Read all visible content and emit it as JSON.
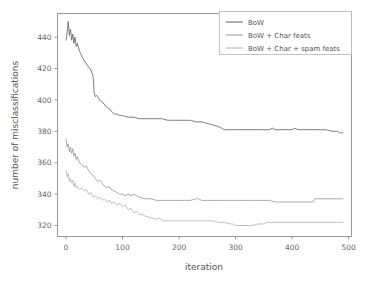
{
  "chart_data": {
    "type": "line",
    "title": "",
    "xlabel": "iteration",
    "ylabel": "number of misclassifications",
    "xlim": [
      -15,
      505
    ],
    "ylim": [
      313,
      455
    ],
    "xticks": [
      0,
      100,
      200,
      300,
      400,
      500
    ],
    "yticks": [
      320,
      340,
      360,
      380,
      400,
      420,
      440
    ],
    "grid": false,
    "legend_position": "upper right",
    "series": [
      {
        "name": "BoW",
        "color": "#6e6e6e",
        "x": [
          0,
          2,
          4,
          6,
          8,
          10,
          12,
          14,
          16,
          18,
          20,
          24,
          28,
          32,
          36,
          40,
          44,
          46,
          48,
          50,
          52,
          54,
          58,
          62,
          66,
          70,
          74,
          78,
          82,
          86,
          90,
          95,
          100,
          110,
          120,
          130,
          140,
          150,
          160,
          170,
          180,
          190,
          200,
          210,
          220,
          230,
          240,
          250,
          260,
          270,
          280,
          285,
          290,
          300,
          320,
          340,
          360,
          365,
          370,
          380,
          400,
          405,
          410,
          430,
          450,
          460,
          470,
          480,
          485,
          490
        ],
        "y": [
          438,
          443,
          450,
          441,
          445,
          438,
          442,
          436,
          440,
          434,
          436,
          431,
          428,
          425,
          423,
          421,
          419,
          417,
          415,
          404,
          402,
          403,
          401,
          399,
          398,
          396,
          395,
          394,
          392,
          391,
          391,
          390,
          390,
          389,
          389,
          388,
          388,
          388,
          388,
          388,
          387,
          387,
          387,
          387,
          387,
          386,
          386,
          385,
          384,
          383,
          381,
          381,
          381,
          381,
          381,
          381,
          381,
          382,
          381,
          381,
          381,
          382,
          381,
          381,
          381,
          381,
          380,
          380,
          379,
          379
        ]
      },
      {
        "name": "BoW + Char feats",
        "color": "#a0a0a0",
        "x": [
          0,
          2,
          4,
          6,
          8,
          10,
          12,
          14,
          16,
          18,
          20,
          24,
          28,
          32,
          36,
          40,
          44,
          48,
          52,
          56,
          60,
          64,
          68,
          72,
          76,
          80,
          85,
          90,
          95,
          100,
          105,
          110,
          115,
          120,
          125,
          130,
          140,
          150,
          160,
          170,
          180,
          190,
          200,
          210,
          220,
          230,
          235,
          240,
          250,
          260,
          270,
          280,
          290,
          300,
          310,
          320,
          330,
          340,
          350,
          360,
          370,
          380,
          390,
          400,
          410,
          420,
          430,
          437,
          440,
          450,
          460,
          470,
          480,
          490
        ],
        "y": [
          375,
          370,
          372,
          367,
          370,
          366,
          369,
          364,
          366,
          362,
          364,
          360,
          359,
          357,
          358,
          355,
          353,
          352,
          350,
          348,
          349,
          347,
          345,
          344,
          345,
          343,
          342,
          341,
          340,
          340,
          339,
          340,
          339,
          340,
          339,
          338,
          337,
          337,
          336,
          336,
          336,
          336,
          336,
          336,
          336,
          337,
          337,
          336,
          336,
          336,
          336,
          336,
          336,
          336,
          336,
          336,
          336,
          336,
          336,
          336,
          335,
          335,
          335,
          335,
          335,
          335,
          335,
          335,
          337,
          337,
          337,
          337,
          337,
          337
        ]
      },
      {
        "name": "BoW + Char + spam feats",
        "color": "#b8b8b8",
        "x": [
          0,
          2,
          4,
          6,
          8,
          10,
          12,
          14,
          16,
          18,
          20,
          24,
          28,
          32,
          36,
          40,
          44,
          48,
          52,
          56,
          60,
          64,
          68,
          72,
          76,
          80,
          85,
          90,
          95,
          100,
          105,
          110,
          115,
          120,
          125,
          130,
          135,
          140,
          150,
          160,
          165,
          170,
          180,
          190,
          200,
          210,
          220,
          230,
          240,
          250,
          260,
          270,
          280,
          290,
          295,
          300,
          310,
          315,
          320,
          325,
          330,
          340,
          345,
          350,
          355,
          360,
          380,
          400,
          420,
          440,
          460,
          480,
          490
        ],
        "y": [
          355,
          351,
          353,
          348,
          350,
          347,
          349,
          345,
          347,
          344,
          345,
          343,
          344,
          342,
          343,
          340,
          341,
          338,
          339,
          337,
          338,
          336,
          337,
          335,
          336,
          334,
          335,
          333,
          334,
          332,
          333,
          330,
          331,
          328,
          329,
          327,
          327,
          326,
          325,
          324,
          325,
          323,
          323,
          323,
          323,
          323,
          323,
          323,
          323,
          323,
          323,
          322,
          322,
          321,
          321,
          320,
          320,
          320,
          320,
          320,
          320,
          321,
          321,
          321,
          322,
          322,
          322,
          322,
          322,
          322,
          322,
          322,
          322
        ]
      }
    ]
  },
  "legend": {
    "items": [
      {
        "label": "BoW"
      },
      {
        "label": "BoW + Char feats"
      },
      {
        "label": "BoW + Char + spam feats"
      }
    ]
  },
  "axes": {
    "x_tick_labels": [
      "0",
      "100",
      "200",
      "300",
      "400",
      "500"
    ],
    "y_tick_labels": [
      "320",
      "340",
      "360",
      "380",
      "400",
      "420",
      "440"
    ],
    "xlabel": "iteration",
    "ylabel": "number of misclassifications"
  },
  "style": {
    "frame_color": "#9a9a9a",
    "tick_color": "#9a9a9a",
    "background": "#ffffff"
  }
}
